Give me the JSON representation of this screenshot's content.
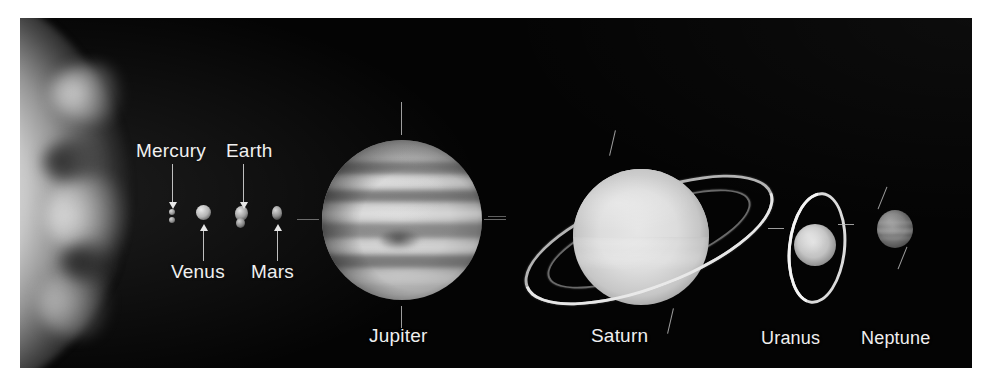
{
  "figure": {
    "kind": "solar-system-scale-photo",
    "medium": "grayscale astronomical photograph",
    "background_color": "#040404",
    "page_color": "#ffffff",
    "label_color": "#efefef"
  },
  "sun": {
    "name": "Sun",
    "position": "left edge",
    "description": "bright irregular solar limb fading into black"
  },
  "planets": [
    {
      "id": "mercury",
      "label": "Mercury",
      "label_position": "above",
      "label_x": 136,
      "label_y": 140,
      "arrow": "down",
      "body_x": 152,
      "body_y": 213,
      "body_size": 6
    },
    {
      "id": "venus",
      "label": "Venus",
      "label_position": "below",
      "label_x": 171,
      "label_y": 261,
      "arrow": "up",
      "body_x": 183,
      "body_y": 212,
      "body_size": 15
    },
    {
      "id": "earth",
      "label": "Earth",
      "label_position": "above",
      "label_x": 226,
      "label_y": 140,
      "arrow": "down",
      "body_x": 221,
      "body_y": 213,
      "body_size": 15
    },
    {
      "id": "mars",
      "label": "Mars",
      "label_position": "below",
      "label_x": 251,
      "label_y": 261,
      "arrow": "up",
      "body_x": 257,
      "body_y": 213,
      "body_size": 14
    },
    {
      "id": "jupiter",
      "label": "Jupiter",
      "label_position": "below",
      "label_x": 369,
      "label_y": 325,
      "arrow": "none",
      "body_x": 382,
      "body_y": 220,
      "body_size": 160
    },
    {
      "id": "saturn",
      "label": "Saturn",
      "label_position": "below",
      "label_x": 591,
      "label_y": 325,
      "arrow": "none",
      "body_x": 573,
      "body_y": 219,
      "body_size": 136,
      "has_rings": true
    },
    {
      "id": "uranus",
      "label": "Uranus",
      "label_position": "below",
      "label_x": 761,
      "label_y": 328,
      "arrow": "none",
      "body_x": 794,
      "body_y": 226,
      "body_size": 42,
      "has_rings": true
    },
    {
      "id": "neptune",
      "label": "Neptune",
      "label_position": "below",
      "label_x": 861,
      "label_y": 328,
      "arrow": "none",
      "body_x": 875,
      "body_y": 211,
      "body_size": 38
    }
  ],
  "labels": {
    "mercury": "Mercury",
    "venus": "Venus",
    "earth": "Earth",
    "mars": "Mars",
    "jupiter": "Jupiter",
    "saturn": "Saturn",
    "uranus": "Uranus",
    "neptune": "Neptune"
  },
  "annotations": {
    "tick_marks": "thin white axis and equator hairlines on Jupiter, Saturn, Uranus and Neptune",
    "ring_systems": [
      "saturn",
      "uranus"
    ]
  }
}
